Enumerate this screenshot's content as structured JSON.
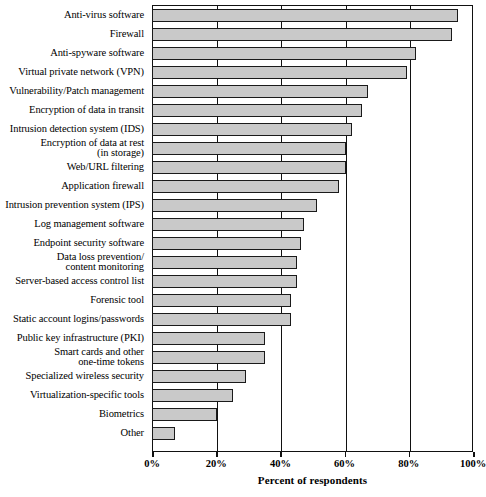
{
  "chart_data": {
    "type": "bar",
    "orientation": "horizontal",
    "title": "",
    "xlabel": "Percent of respondents",
    "ylabel": "",
    "xlim": [
      0,
      100
    ],
    "xticks": [
      0,
      20,
      40,
      60,
      80,
      100
    ],
    "xtick_labels": [
      "0%",
      "20%",
      "40%",
      "60%",
      "80%",
      "100%"
    ],
    "grid": true,
    "legend": null,
    "bar_fill_color": "#c9c9c9",
    "bar_edge_color": "#1a1a1a",
    "categories": [
      "Anti-virus software",
      "Firewall",
      "Anti-spyware software",
      "Virtual private network (VPN)",
      "Vulnerability/Patch management",
      "Encryption of data in transit",
      "Intrusion detection system (IDS)",
      "Encryption of data at rest\n(in storage)",
      "Web/URL filtering",
      "Application firewall",
      "Intrusion prevention system (IPS)",
      "Log management software",
      "Endpoint security software",
      "Data loss prevention/\ncontent monitoring",
      "Server-based access control list",
      "Forensic tool",
      "Static account logins/passwords",
      "Public key infrastructure (PKI)",
      "Smart cards and other\none-time tokens",
      "Specialized wireless security",
      "Virtualization-specific tools",
      "Biometrics",
      "Other"
    ],
    "values": [
      95,
      93,
      82,
      79,
      67,
      65,
      62,
      60,
      60,
      58,
      51,
      47,
      46,
      45,
      45,
      43,
      43,
      35,
      35,
      29,
      25,
      20,
      7
    ]
  }
}
